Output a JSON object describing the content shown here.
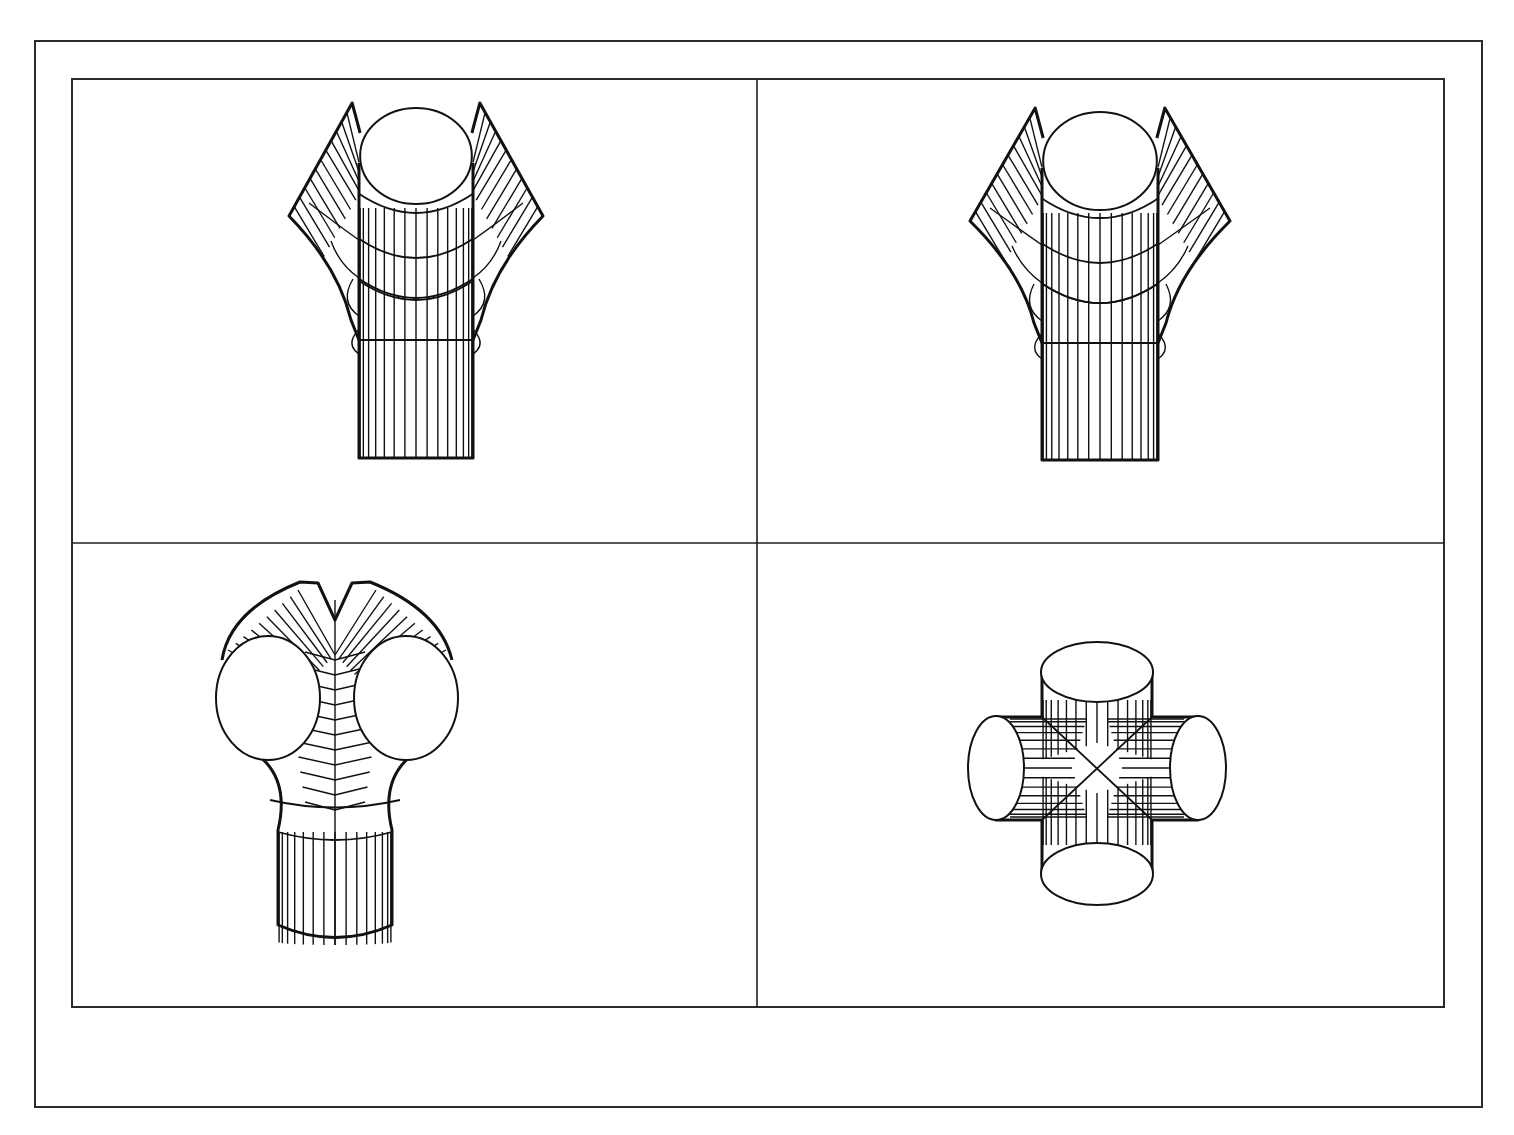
{
  "figure": {
    "layout": {
      "rows": 2,
      "cols": 2
    },
    "colors": {
      "line": "#111111",
      "frame": "#2b2b2b",
      "background": "#ffffff"
    },
    "panels": [
      {
        "id": "top-left",
        "label": "Y-branch pipe, front view (variant A)",
        "type": "y-junction"
      },
      {
        "id": "top-right",
        "label": "Y-branch pipe, front view (variant B)",
        "type": "y-junction"
      },
      {
        "id": "bottom-left",
        "label": "Y-branch pipe, tilted view showing both branch openings",
        "type": "y-junction-tilted"
      },
      {
        "id": "bottom-right",
        "label": "Four-way cross junction",
        "type": "cross-junction"
      }
    ]
  }
}
